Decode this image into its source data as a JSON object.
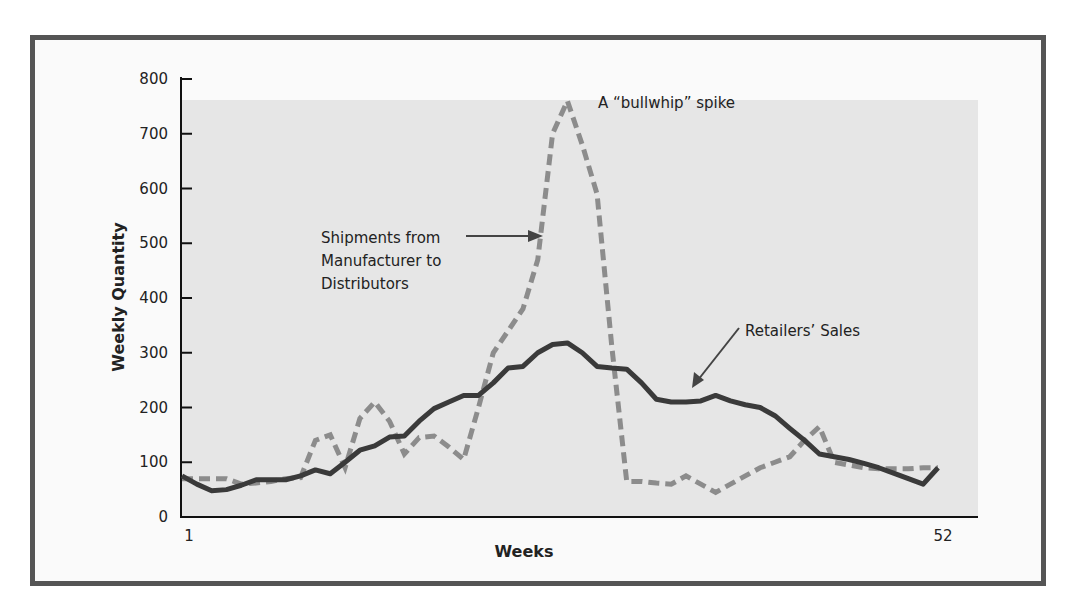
{
  "chart_data": {
    "type": "line",
    "title": "",
    "xlabel": "Weeks",
    "ylabel": "Weekly Quantity",
    "ylim": [
      0,
      800
    ],
    "yticks": [
      0,
      100,
      200,
      300,
      400,
      500,
      600,
      700,
      800
    ],
    "xtick_labels": [
      "1",
      "52"
    ],
    "xlim": [
      1,
      52
    ],
    "grid": false,
    "legend": "none (inline annotations)",
    "annotations": [
      {
        "text": "A “bullwhip” spike",
        "target": "peak of Shipments series"
      },
      {
        "text": "Shipments from Manufacturer to Distributors",
        "target": "Shipments series",
        "arrow": true
      },
      {
        "text": "Retailers’ Sales",
        "target": "Retailers' Sales series",
        "arrow": true
      }
    ],
    "x": [
      1,
      2,
      3,
      4,
      5,
      6,
      7,
      8,
      9,
      10,
      11,
      12,
      13,
      14,
      15,
      16,
      17,
      18,
      19,
      20,
      21,
      22,
      23,
      24,
      25,
      26,
      27,
      28,
      29,
      30,
      31,
      32,
      33,
      34,
      35,
      36,
      37,
      38,
      39,
      40,
      41,
      42,
      43,
      44,
      45,
      46,
      47,
      48,
      49,
      50,
      51,
      52
    ],
    "series": [
      {
        "name": "Retailers' Sales",
        "style": "solid",
        "color": "#3a3a3a",
        "values": [
          75,
          60,
          48,
          50,
          58,
          68,
          68,
          68,
          75,
          86,
          79,
          100,
          122,
          130,
          146,
          148,
          175,
          198,
          210,
          222,
          222,
          245,
          272,
          275,
          300,
          315,
          318,
          300,
          275,
          272,
          270,
          245,
          215,
          210,
          210,
          212,
          222,
          212,
          205,
          200,
          185,
          162,
          140,
          115,
          110,
          105,
          98,
          90,
          80,
          70,
          60,
          90
        ]
      },
      {
        "name": "Shipments from Manufacturer to Distributors",
        "style": "dashed",
        "color": "#8a8a8a",
        "values": [
          70,
          70,
          70,
          70,
          60,
          62,
          65,
          70,
          72,
          140,
          150,
          90,
          180,
          210,
          175,
          115,
          145,
          148,
          128,
          105,
          200,
          300,
          340,
          380,
          470,
          700,
          760,
          680,
          590,
          310,
          65,
          65,
          62,
          60,
          75,
          60,
          45,
          60,
          75,
          90,
          100,
          110,
          140,
          165,
          100,
          95,
          90,
          88,
          88,
          88,
          90,
          90
        ]
      }
    ]
  },
  "labels": {
    "ylabel": "Weekly Quantity",
    "xlabel": "Weeks",
    "x_start": "1",
    "x_end": "52",
    "bullwhip": "A “bullwhip” spike",
    "shipments_line1": "Shipments from",
    "shipments_line2": "Manufacturer to",
    "shipments_line3": "Distributors",
    "retail": "Retailers’ Sales",
    "ticks": [
      "0",
      "100",
      "200",
      "300",
      "400",
      "500",
      "600",
      "700",
      "800"
    ]
  }
}
